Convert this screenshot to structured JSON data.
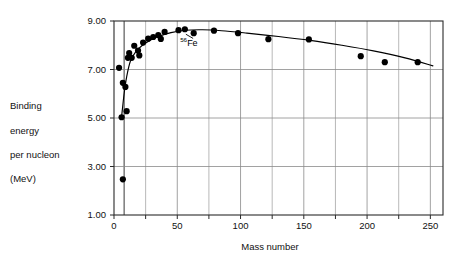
{
  "chart_data": {
    "type": "scatter",
    "title": "",
    "xlabel": "Mass number",
    "ylabel": "Binding energy per nucleon (MeV)",
    "ylabel_lines": [
      "Binding",
      "energy",
      "per nucleon",
      "(MeV)"
    ],
    "xlim": [
      0,
      260
    ],
    "ylim": [
      1.0,
      9.0
    ],
    "xticks": [
      0,
      25,
      50,
      75,
      100,
      125,
      150,
      175,
      200,
      225,
      250
    ],
    "xtick_labels": [
      "0",
      "",
      "50",
      "",
      "100",
      "",
      "150",
      "",
      "200",
      "",
      "250"
    ],
    "xticks_major": [
      0,
      50,
      100,
      150,
      200,
      250
    ],
    "yticks": [
      1.0,
      3.0,
      5.0,
      7.0,
      9.0
    ],
    "ytick_labels": [
      "1.00",
      "3.00",
      "5.00",
      "7.00",
      "9.00"
    ],
    "grid": true,
    "grid_vertical_emphasis_x": 8,
    "legend": "none",
    "marker": "filled-circle",
    "marker_color": "#000000",
    "line_color": "#000000",
    "points": [
      {
        "x": 4,
        "y": 7.07
      },
      {
        "x": 6,
        "y": 5.03
      },
      {
        "x": 7,
        "y": 2.47
      },
      {
        "x": 7,
        "y": 6.45
      },
      {
        "x": 9,
        "y": 6.28
      },
      {
        "x": 10,
        "y": 5.28
      },
      {
        "x": 11,
        "y": 7.48
      },
      {
        "x": 12,
        "y": 7.68
      },
      {
        "x": 14,
        "y": 7.48
      },
      {
        "x": 16,
        "y": 7.98
      },
      {
        "x": 19,
        "y": 7.78
      },
      {
        "x": 20,
        "y": 7.58
      },
      {
        "x": 23,
        "y": 8.11
      },
      {
        "x": 27,
        "y": 8.27
      },
      {
        "x": 31,
        "y": 8.34
      },
      {
        "x": 35,
        "y": 8.42
      },
      {
        "x": 37,
        "y": 8.26
      },
      {
        "x": 40,
        "y": 8.55
      },
      {
        "x": 51,
        "y": 8.62
      },
      {
        "x": 56,
        "y": 8.66
      },
      {
        "x": 63,
        "y": 8.5
      },
      {
        "x": 79,
        "y": 8.6
      },
      {
        "x": 98,
        "y": 8.5
      },
      {
        "x": 122,
        "y": 8.25
      },
      {
        "x": 154,
        "y": 8.24
      },
      {
        "x": 195,
        "y": 7.55
      },
      {
        "x": 214,
        "y": 7.3
      },
      {
        "x": 240,
        "y": 7.3
      }
    ],
    "trend_curve": [
      {
        "x": 6,
        "y": 5.05
      },
      {
        "x": 8,
        "y": 6.0
      },
      {
        "x": 10,
        "y": 6.7
      },
      {
        "x": 13,
        "y": 7.35
      },
      {
        "x": 17,
        "y": 7.72
      },
      {
        "x": 22,
        "y": 7.98
      },
      {
        "x": 28,
        "y": 8.19
      },
      {
        "x": 35,
        "y": 8.36
      },
      {
        "x": 45,
        "y": 8.52
      },
      {
        "x": 56,
        "y": 8.62
      },
      {
        "x": 70,
        "y": 8.64
      },
      {
        "x": 85,
        "y": 8.6
      },
      {
        "x": 105,
        "y": 8.5
      },
      {
        "x": 130,
        "y": 8.36
      },
      {
        "x": 155,
        "y": 8.2
      },
      {
        "x": 180,
        "y": 8.0
      },
      {
        "x": 205,
        "y": 7.77
      },
      {
        "x": 230,
        "y": 7.48
      },
      {
        "x": 252,
        "y": 7.15
      }
    ],
    "annotations": [
      {
        "name": "iron-56",
        "superscript": "56",
        "text": "Fe",
        "label_x": 57,
        "label_y": 7.95,
        "target_x": 56,
        "target_y": 8.62
      }
    ]
  }
}
